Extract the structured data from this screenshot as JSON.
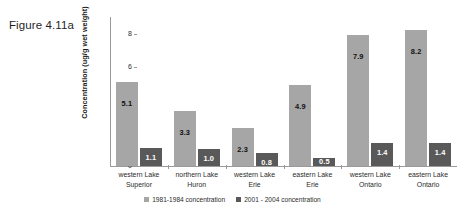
{
  "figure": {
    "caption": "Figure 4.11a"
  },
  "chart_data": {
    "type": "bar",
    "title": "",
    "xlabel": "",
    "ylabel": "Concentration (ug/g wet weight)",
    "ylim": [
      0,
      9
    ],
    "yticks": [
      "0",
      "2",
      "4",
      "6",
      "8"
    ],
    "ytick_values": [
      0,
      2,
      4,
      6,
      8
    ],
    "grid": false,
    "legend_position": "bottom",
    "categories": [
      "western Lake Superior",
      "northern Lake Huron",
      "western Lake Erie",
      "eastern Lake Erie",
      "western Lake Ontario",
      "eastern Lake Ontario"
    ],
    "category_lines": [
      [
        "western Lake",
        "Superior"
      ],
      [
        "northern Lake",
        "Huron"
      ],
      [
        "western Lake",
        "Erie"
      ],
      [
        "eastern Lake",
        "Erie"
      ],
      [
        "western Lake",
        "Ontario"
      ],
      [
        "eastern Lake",
        "Ontario"
      ]
    ],
    "series": [
      {
        "name": "1981-1984 concentration",
        "color": "#a6a6a6",
        "values": [
          5.1,
          3.3,
          2.3,
          4.9,
          7.9,
          8.2
        ],
        "labels": [
          "5.1",
          "3.3",
          "2.3",
          "4.9",
          "7.9",
          "8.2"
        ]
      },
      {
        "name": "2001 - 2004 concentration",
        "color": "#595959",
        "values": [
          1.1,
          1.0,
          0.8,
          0.5,
          1.4,
          1.4
        ],
        "labels": [
          "1.1",
          "1.0",
          "0.8",
          "0.5",
          "1.4",
          "1.4"
        ]
      }
    ]
  },
  "legend": {
    "items": [
      {
        "label": "1981-1984 concentration",
        "color": "#a6a6a6"
      },
      {
        "label": "2001 - 2004 concentration",
        "color": "#595959"
      }
    ]
  }
}
